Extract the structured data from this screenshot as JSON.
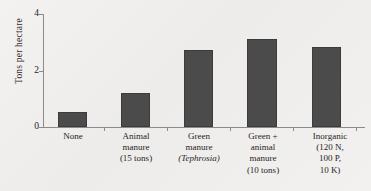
{
  "chart_data": {
    "type": "bar",
    "title": "",
    "subtitle": "",
    "xlabel": "",
    "ylabel": "Tons per hectare",
    "ylim": [
      0,
      4
    ],
    "yticks": [
      0,
      2,
      4
    ],
    "ytick_labels": [
      "0",
      "2",
      "4"
    ],
    "grid": false,
    "legend": "none",
    "bar_color": "#4b4b4b",
    "axis_color": "#8b8b8b",
    "background_color": "#f2f0ee",
    "categories": [
      "None",
      "Animal manure (15 tons)",
      "Green manure (Tephrosia)",
      "Green + animal manure (10 tons)",
      "Inorganic (120 N, 100 P, 10 K)"
    ],
    "category_lines": [
      [
        "None"
      ],
      [
        "Animal",
        "manure",
        "(15 tons)"
      ],
      [
        "Green",
        "manure",
        "(Tephrosia)"
      ],
      [
        "Green +",
        "animal",
        "manure",
        "(10 tons)"
      ],
      [
        "Inorganic",
        "(120 N,",
        "100 P,",
        "10 K)"
      ]
    ],
    "values": [
      0.55,
      1.2,
      2.75,
      3.15,
      2.85
    ]
  }
}
